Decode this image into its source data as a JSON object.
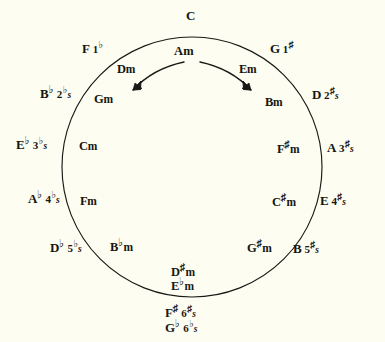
{
  "diagram": {
    "background_color": "#fdfdf2",
    "ink_color": "#15150f",
    "circle": {
      "cx": 192,
      "cy": 167,
      "r": 130
    }
  },
  "top_key": {
    "name": "C",
    "accidental": "",
    "signature_count": "",
    "signature_symbol": ""
  },
  "top_minor": {
    "name": "Am"
  },
  "arrows": [
    {
      "name": "flats-direction-arrow",
      "direction": "counterclockwise-left"
    },
    {
      "name": "sharps-direction-arrow",
      "direction": "clockwise-right"
    }
  ],
  "flat_keys": [
    {
      "root": "F",
      "accidental": "",
      "count": "1",
      "symbol": "♭",
      "plural": "",
      "minor_root": "D",
      "minor_accidental": "",
      "minor_suffix": "m"
    },
    {
      "root": "B",
      "accidental": "♭",
      "count": "2",
      "symbol": "♭",
      "plural": "s",
      "minor_root": "G",
      "minor_accidental": "",
      "minor_suffix": "m"
    },
    {
      "root": "E",
      "accidental": "♭",
      "count": "3",
      "symbol": "♭",
      "plural": "s",
      "minor_root": "C",
      "minor_accidental": "",
      "minor_suffix": "m"
    },
    {
      "root": "A",
      "accidental": "♭",
      "count": "4",
      "symbol": "♭",
      "plural": "s",
      "minor_root": "F",
      "minor_accidental": "",
      "minor_suffix": "m"
    },
    {
      "root": "D",
      "accidental": "♭",
      "count": "5",
      "symbol": "♭",
      "plural": "s",
      "minor_root": "B",
      "minor_accidental": "♭",
      "minor_suffix": "m"
    }
  ],
  "sharp_keys": [
    {
      "root": "G",
      "accidental": "",
      "count": "1",
      "symbol": "♯",
      "plural": "",
      "minor_root": "E",
      "minor_accidental": "",
      "minor_suffix": "m"
    },
    {
      "root": "D",
      "accidental": "",
      "count": "2",
      "symbol": "♯",
      "plural": "s",
      "minor_root": "B",
      "minor_accidental": "",
      "minor_suffix": "m"
    },
    {
      "root": "A",
      "accidental": "",
      "count": "3",
      "symbol": "♯",
      "plural": "s",
      "minor_root": "F",
      "minor_accidental": "♯",
      "minor_suffix": "m"
    },
    {
      "root": "E",
      "accidental": "",
      "count": "4",
      "symbol": "♯",
      "plural": "s",
      "minor_root": "C",
      "minor_accidental": "♯",
      "minor_suffix": "m"
    },
    {
      "root": "B",
      "accidental": "",
      "count": "5",
      "symbol": "♯",
      "plural": "s",
      "minor_root": "G",
      "minor_accidental": "♯",
      "minor_suffix": "m"
    }
  ],
  "bottom_enharmonic_major": {
    "sharp_row": {
      "root": "F",
      "accidental": "♯",
      "count": "6",
      "symbol": "♯",
      "plural": "s"
    },
    "flat_row": {
      "root": "G",
      "accidental": "♭",
      "count": "6",
      "symbol": "♭",
      "plural": "s"
    }
  },
  "bottom_enharmonic_minor": {
    "sharp_row": {
      "root": "D",
      "accidental": "♯",
      "suffix": "m"
    },
    "flat_row": {
      "root": "E",
      "accidental": "♭",
      "suffix": "m"
    }
  }
}
